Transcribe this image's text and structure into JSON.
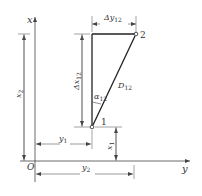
{
  "diagram": {
    "type": "coordinate-geometry",
    "axes": {
      "vertical_label": "x",
      "horizontal_label": "y",
      "origin_label": "O"
    },
    "points": [
      {
        "id": "1",
        "label": "1"
      },
      {
        "id": "2",
        "label": "2"
      }
    ],
    "labels": {
      "delta_y": "Δy",
      "delta_y_sub": "12",
      "delta_x": "Δx",
      "delta_x_sub": "12",
      "distance": "D",
      "distance_sub": "12",
      "azimuth": "α",
      "azimuth_sub": "12",
      "x1": "x",
      "x1_sub": "1",
      "x2": "x",
      "x2_sub": "2",
      "y1": "y",
      "y1_sub": "1",
      "y2": "y",
      "y2_sub": "2"
    },
    "colors": {
      "line": "#333333",
      "dim": "#555555"
    }
  }
}
